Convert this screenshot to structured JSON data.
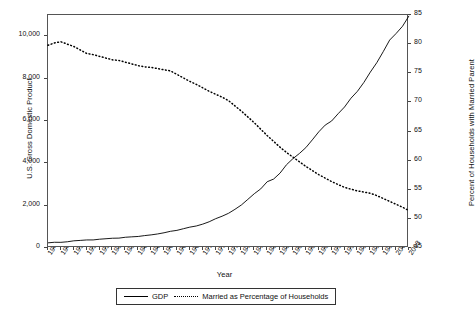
{
  "chart_data": {
    "type": "line",
    "title": "",
    "xlabel": "Year",
    "ylabel": "U.S. Gross Domestic Product",
    "ylabel_right": "Percent of Households with Married Parent",
    "grid": false,
    "legend_position": "bottom",
    "xlim": [
      1947,
      2003
    ],
    "ylim": [
      0,
      11000
    ],
    "ylim_right": [
      45,
      85
    ],
    "yticks": [
      "0",
      "2,000",
      "4,000",
      "6,000",
      "8,000",
      "10,000"
    ],
    "ytick_values": [
      0,
      2000,
      4000,
      6000,
      8000,
      10000
    ],
    "yticks_right": [
      "45",
      "50",
      "55",
      "60",
      "65",
      "70",
      "75",
      "80",
      "85"
    ],
    "ytick_right_values": [
      45,
      50,
      55,
      60,
      65,
      70,
      75,
      80,
      85
    ],
    "xtick_labels": [
      "1947",
      "1949",
      "1951",
      "1953",
      "1955",
      "1957",
      "1959",
      "1961",
      "1963",
      "1965",
      "1967",
      "1969",
      "1971",
      "1973",
      "1975",
      "1977",
      "1979",
      "1981",
      "1983",
      "1985",
      "1987",
      "1989",
      "1991",
      "1993",
      "1995",
      "1997",
      "1999",
      "2001",
      "2003"
    ],
    "x": [
      1947,
      1948,
      1949,
      1950,
      1951,
      1952,
      1953,
      1954,
      1955,
      1956,
      1957,
      1958,
      1959,
      1960,
      1961,
      1962,
      1963,
      1964,
      1965,
      1966,
      1967,
      1968,
      1969,
      1970,
      1971,
      1972,
      1973,
      1974,
      1975,
      1976,
      1977,
      1978,
      1979,
      1980,
      1981,
      1982,
      1983,
      1984,
      1985,
      1986,
      1987,
      1988,
      1989,
      1990,
      1991,
      1992,
      1993,
      1994,
      1995,
      1996,
      1997,
      1998,
      1999,
      2000,
      2001,
      2002,
      2003
    ],
    "series": [
      {
        "name": "GDP",
        "axis": "left",
        "style": "solid",
        "values": [
          244,
          270,
          267,
          294,
          339,
          358,
          380,
          381,
          415,
          438,
          461,
          467,
          507,
          527,
          545,
          586,
          619,
          663,
          719,
          788,
          833,
          910,
          985,
          1039,
          1127,
          1238,
          1383,
          1500,
          1638,
          1825,
          2031,
          2295,
          2563,
          2790,
          3128,
          3255,
          3537,
          3933,
          4220,
          4463,
          4740,
          5104,
          5484,
          5803,
          5996,
          6338,
          6657,
          7072,
          7398,
          7817,
          8304,
          8747,
          9268,
          9817,
          10128,
          10470,
          10960
        ]
      },
      {
        "name": "Married as Percentage of Households",
        "axis": "right",
        "style": "dotted",
        "values": [
          79.8,
          80.2,
          80.4,
          80.0,
          79.6,
          79.0,
          78.4,
          78.2,
          77.9,
          77.6,
          77.3,
          77.2,
          76.9,
          76.6,
          76.3,
          76.1,
          76.0,
          75.8,
          75.6,
          75.4,
          74.8,
          74.2,
          73.6,
          73.1,
          72.5,
          71.9,
          71.4,
          70.9,
          70.3,
          69.4,
          68.5,
          67.5,
          66.5,
          65.4,
          64.3,
          63.3,
          62.3,
          61.4,
          60.6,
          59.8,
          59.0,
          58.3,
          57.6,
          57.0,
          56.4,
          55.9,
          55.4,
          55.1,
          54.8,
          54.6,
          54.4,
          54.0,
          53.5,
          53.0,
          52.5,
          52.0,
          51.4
        ]
      }
    ]
  },
  "legend": {
    "items": [
      {
        "label": "GDP",
        "style": "solid"
      },
      {
        "label": "Married as Percentage of Households",
        "style": "dotted"
      }
    ]
  }
}
